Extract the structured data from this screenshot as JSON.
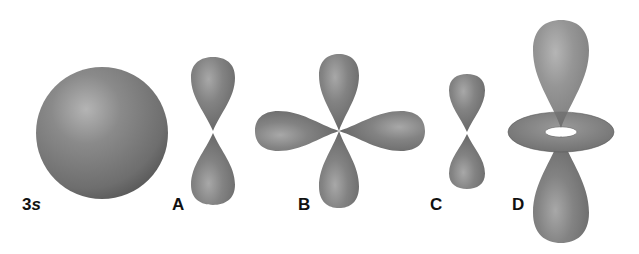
{
  "figure": {
    "colors": {
      "orbital_fill": "#7a7a7a",
      "orbital_shadow": "#4e4e4e",
      "highlight": "#b0b0b0",
      "background": "#ffffff",
      "label": "#111111"
    },
    "orbitals": [
      {
        "id": "3s",
        "label_main": "3",
        "label_sub": "s",
        "shape": "sphere"
      },
      {
        "id": "A",
        "label_main": "A",
        "shape": "dumbbell-vertical (p)"
      },
      {
        "id": "B",
        "label_main": "B",
        "shape": "four-leaf clover (d)"
      },
      {
        "id": "C",
        "label_main": "C",
        "shape": "small dumbbell-vertical (p)"
      },
      {
        "id": "D",
        "label_main": "D",
        "shape": "dumbbell with torus (dz2)"
      }
    ]
  }
}
